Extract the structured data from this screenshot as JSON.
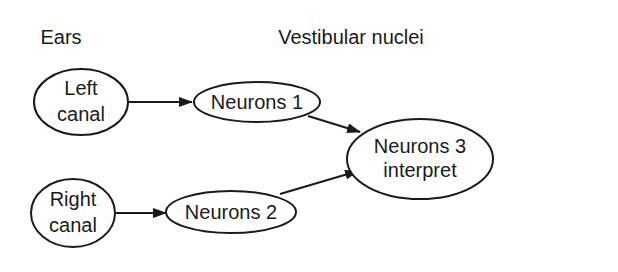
{
  "headings": {
    "ears": "Ears",
    "vestibular": "Vestibular nuclei"
  },
  "nodes": {
    "left_canal": {
      "line1": "Left",
      "line2": "canal"
    },
    "right_canal": {
      "line1": "Right",
      "line2": "canal"
    },
    "neurons1": {
      "label": "Neurons 1"
    },
    "neurons2": {
      "label": "Neurons 2"
    },
    "neurons3": {
      "line1": "Neurons 3",
      "line2": "interpret"
    }
  },
  "edges": [
    {
      "from": "Left canal",
      "to": "Neurons 1"
    },
    {
      "from": "Right canal",
      "to": "Neurons 2"
    },
    {
      "from": "Neurons 1",
      "to": "Neurons 3 interpret"
    },
    {
      "from": "Neurons 2",
      "to": "Neurons 3 interpret"
    }
  ],
  "colors": {
    "stroke": "#1a1a1a",
    "background": "#ffffff"
  }
}
